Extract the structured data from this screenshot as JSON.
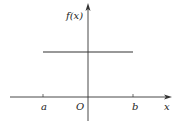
{
  "chart_data": {
    "type": "line",
    "title": "",
    "xlabel": "x",
    "ylabel": "f(x)",
    "origin_label": "O",
    "x_ticks": [
      {
        "label": "a",
        "value": -1
      },
      {
        "label": "b",
        "value": 1
      }
    ],
    "series": [
      {
        "name": "f(x) = constant",
        "x": [
          -1,
          1
        ],
        "y": [
          1,
          1
        ]
      }
    ],
    "xlim": [
      -1.75,
      1.6
    ],
    "ylim": [
      -0.5,
      1.8
    ],
    "grid": false,
    "legend": "none",
    "colors": {
      "axis": "#333333",
      "line": "#333333",
      "text": "#222222"
    }
  }
}
